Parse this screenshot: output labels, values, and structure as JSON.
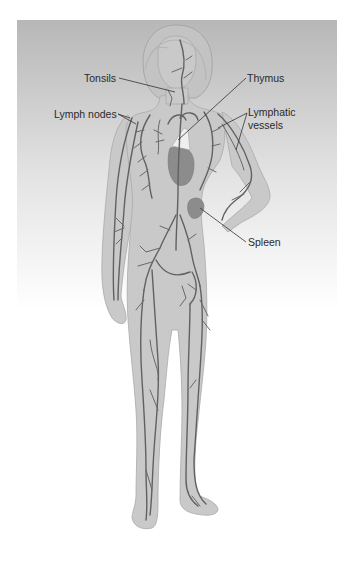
{
  "diagram": {
    "labels": {
      "tonsils": "Tonsils",
      "thymus": "Thymus",
      "lymph_nodes": "Lymph nodes",
      "lymphatic_vessels_line1": "Lymphatic",
      "lymphatic_vessels_line2": "vessels",
      "spleen": "Spleen"
    },
    "colors": {
      "background_top": "#b9b9b9",
      "background_bottom": "#ffffff",
      "body": "#c9c9c9",
      "vessels": "#616161",
      "organs": "#8c8c8c",
      "thymus": "#efefef"
    }
  }
}
